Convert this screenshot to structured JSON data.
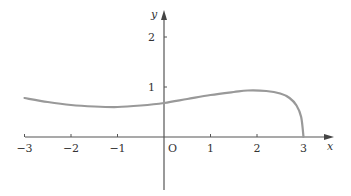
{
  "chart_data": {
    "type": "line",
    "title": "",
    "xlabel": "x",
    "ylabel": "y",
    "origin_label": "O",
    "xlim": [
      -3,
      3.6
    ],
    "ylim": [
      -1.1,
      2.5
    ],
    "grid": false,
    "x_ticks": [
      "-3",
      "-2",
      "-1",
      "1",
      "2",
      "3"
    ],
    "y_ticks": [
      "1",
      "2"
    ],
    "series": [
      {
        "name": "curve",
        "color": "#999999",
        "x": [
          -3,
          -2.5,
          -2,
          -1.5,
          -1,
          -0.5,
          0,
          0.5,
          1,
          1.5,
          1.8,
          2.2,
          2.5,
          2.7,
          2.85,
          2.95,
          3
        ],
        "y": [
          0.78,
          0.7,
          0.64,
          0.61,
          0.6,
          0.63,
          0.68,
          0.76,
          0.84,
          0.9,
          0.93,
          0.92,
          0.87,
          0.78,
          0.63,
          0.4,
          0
        ]
      }
    ]
  },
  "colors": {
    "axis": "#555555",
    "curve": "#999999"
  }
}
